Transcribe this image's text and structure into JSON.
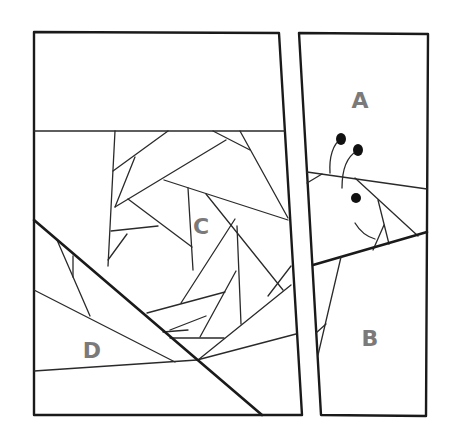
{
  "diagram": {
    "type": "paper-piecing-pattern",
    "colors": {
      "background": "#ffffff",
      "line": "#1a1a1a",
      "label": "#7a7a7a"
    },
    "sections": [
      {
        "id": "A",
        "label": "A",
        "x": 360,
        "y": 108
      },
      {
        "id": "B",
        "label": "B",
        "x": 370,
        "y": 346
      },
      {
        "id": "C",
        "label": "C",
        "x": 201,
        "y": 234
      },
      {
        "id": "D",
        "label": "D",
        "x": 92,
        "y": 358
      }
    ]
  }
}
